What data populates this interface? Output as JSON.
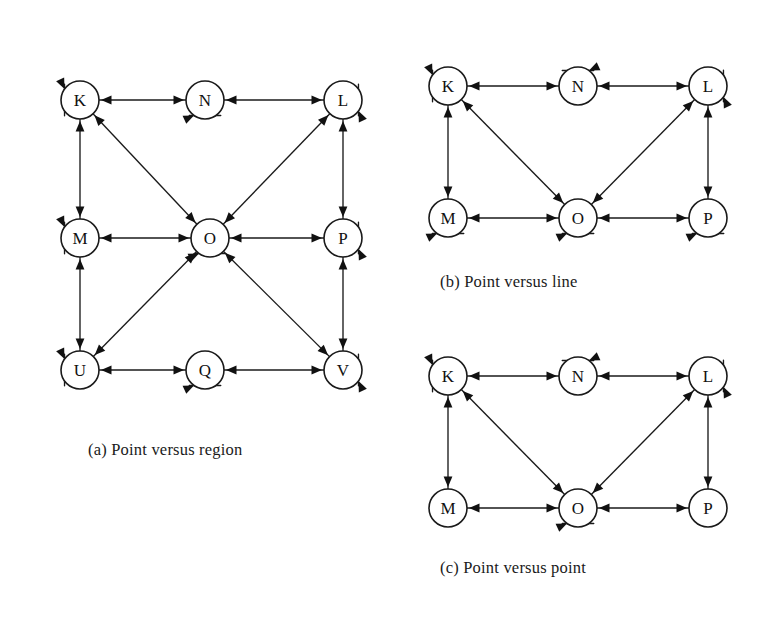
{
  "figure": {
    "background_color": "#ffffff",
    "stroke_color": "#1a1a1a",
    "node_fill": "#ffffff",
    "panels": [
      {
        "id": "a",
        "caption": "(a) Point versus region",
        "chart_data": {
          "type": "diagram",
          "title": "(a) Point versus region",
          "graph_kind": "directed-graph",
          "node_radius": 19,
          "nodes": [
            {
              "id": "K",
              "label": "K",
              "x": 80,
              "y": 100,
              "self_loop": "left"
            },
            {
              "id": "N",
              "label": "N",
              "x": 205,
              "y": 100,
              "self_loop": "bottom"
            },
            {
              "id": "L",
              "label": "L",
              "x": 343,
              "y": 100,
              "self_loop": "right"
            },
            {
              "id": "M",
              "label": "M",
              "x": 80,
              "y": 238,
              "self_loop": "left"
            },
            {
              "id": "O",
              "label": "O",
              "x": 210,
              "y": 238,
              "self_loop": "bottom"
            },
            {
              "id": "P",
              "label": "P",
              "x": 343,
              "y": 238,
              "self_loop": "right"
            },
            {
              "id": "U",
              "label": "U",
              "x": 80,
              "y": 370,
              "self_loop": "left"
            },
            {
              "id": "Q",
              "label": "Q",
              "x": 205,
              "y": 370,
              "self_loop": "bottom"
            },
            {
              "id": "V",
              "label": "V",
              "x": 343,
              "y": 370,
              "self_loop": "right"
            }
          ],
          "edges": [
            {
              "from": "K",
              "to": "N",
              "dir": "both"
            },
            {
              "from": "N",
              "to": "L",
              "dir": "both"
            },
            {
              "from": "K",
              "to": "M",
              "dir": "both"
            },
            {
              "from": "M",
              "to": "U",
              "dir": "both"
            },
            {
              "from": "L",
              "to": "P",
              "dir": "both"
            },
            {
              "from": "P",
              "to": "V",
              "dir": "both"
            },
            {
              "from": "U",
              "to": "Q",
              "dir": "both"
            },
            {
              "from": "Q",
              "to": "V",
              "dir": "both"
            },
            {
              "from": "M",
              "to": "O",
              "dir": "both"
            },
            {
              "from": "O",
              "to": "P",
              "dir": "both"
            },
            {
              "from": "K",
              "to": "O",
              "dir": "both"
            },
            {
              "from": "L",
              "to": "O",
              "dir": "both"
            },
            {
              "from": "U",
              "to": "O",
              "dir": "both"
            },
            {
              "from": "V",
              "to": "O",
              "dir": "both"
            }
          ]
        }
      },
      {
        "id": "b",
        "caption": "(b) Point versus line",
        "chart_data": {
          "type": "diagram",
          "title": "(b) Point versus line",
          "graph_kind": "directed-graph",
          "node_radius": 19,
          "nodes": [
            {
              "id": "K",
              "label": "K",
              "x": 448,
              "y": 86,
              "self_loop": "left"
            },
            {
              "id": "N",
              "label": "N",
              "x": 578,
              "y": 86,
              "self_loop": "top"
            },
            {
              "id": "L",
              "label": "L",
              "x": 708,
              "y": 86,
              "self_loop": "right"
            },
            {
              "id": "M",
              "label": "M",
              "x": 448,
              "y": 218,
              "self_loop": "bottom"
            },
            {
              "id": "O",
              "label": "O",
              "x": 578,
              "y": 218,
              "self_loop": "bottom"
            },
            {
              "id": "P",
              "label": "P",
              "x": 708,
              "y": 218,
              "self_loop": "bottom"
            }
          ],
          "edges": [
            {
              "from": "K",
              "to": "N",
              "dir": "both"
            },
            {
              "from": "N",
              "to": "L",
              "dir": "both"
            },
            {
              "from": "K",
              "to": "M",
              "dir": "both"
            },
            {
              "from": "L",
              "to": "P",
              "dir": "both"
            },
            {
              "from": "M",
              "to": "O",
              "dir": "both"
            },
            {
              "from": "O",
              "to": "P",
              "dir": "both"
            },
            {
              "from": "K",
              "to": "O",
              "dir": "both"
            },
            {
              "from": "L",
              "to": "O",
              "dir": "both"
            }
          ]
        }
      },
      {
        "id": "c",
        "caption": "(c) Point versus point",
        "chart_data": {
          "type": "diagram",
          "title": "(c) Point versus point",
          "graph_kind": "directed-graph",
          "node_radius": 19,
          "nodes": [
            {
              "id": "K",
              "label": "K",
              "x": 448,
              "y": 376,
              "self_loop": "left"
            },
            {
              "id": "N",
              "label": "N",
              "x": 578,
              "y": 376,
              "self_loop": "top"
            },
            {
              "id": "L",
              "label": "L",
              "x": 708,
              "y": 376,
              "self_loop": "right"
            },
            {
              "id": "M",
              "label": "M",
              "x": 448,
              "y": 508,
              "self_loop": "none"
            },
            {
              "id": "O",
              "label": "O",
              "x": 578,
              "y": 508,
              "self_loop": "bottom"
            },
            {
              "id": "P",
              "label": "P",
              "x": 708,
              "y": 508,
              "self_loop": "none"
            }
          ],
          "edges": [
            {
              "from": "K",
              "to": "N",
              "dir": "both"
            },
            {
              "from": "N",
              "to": "L",
              "dir": "both"
            },
            {
              "from": "K",
              "to": "M",
              "dir": "both"
            },
            {
              "from": "L",
              "to": "P",
              "dir": "both"
            },
            {
              "from": "M",
              "to": "O",
              "dir": "both"
            },
            {
              "from": "O",
              "to": "P",
              "dir": "both"
            },
            {
              "from": "K",
              "to": "O",
              "dir": "both"
            },
            {
              "from": "L",
              "to": "O",
              "dir": "both"
            }
          ]
        }
      }
    ]
  }
}
